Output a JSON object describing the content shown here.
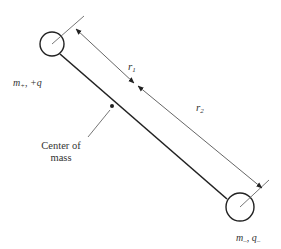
{
  "diagram": {
    "type": "dumbbell-dipole",
    "labels": {
      "top_mass": "m",
      "top_mass_sub": "+",
      "top_charge": ", +q",
      "bottom_mass": "m",
      "bottom_mass_sub": "–",
      "bottom_charge_sep": ", ",
      "bottom_charge": "q",
      "bottom_charge_sub": "–",
      "r1": "r",
      "r1_sub": "1",
      "r2": "r",
      "r2_sub": "2",
      "center_of_mass_line1": "Center of",
      "center_of_mass_line2": "mass"
    },
    "colors": {
      "stroke": "#222222",
      "arrow": "#555555",
      "text": "#333333",
      "background": "#ffffff"
    }
  }
}
